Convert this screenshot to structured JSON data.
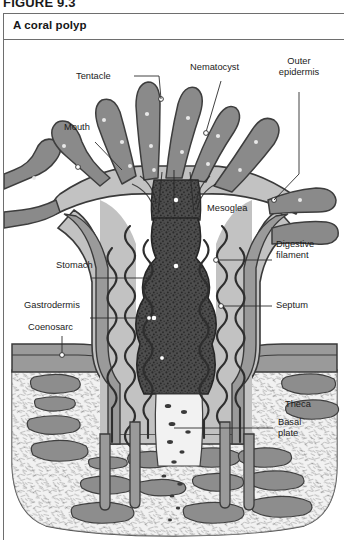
{
  "figure": {
    "number": "FIGURE 9.3",
    "title": "A coral polyp"
  },
  "labels": {
    "tentacle": "Tentacle",
    "nematocyst": "Nematocyst",
    "outer_epidermis_line1": "Outer",
    "outer_epidermis_line2": "epidermis",
    "mouth": "Mouth",
    "mesoglea": "Mesoglea",
    "digestive_filament_line1": "Digestive",
    "digestive_filament_line2": "filament",
    "stomach": "Stomach",
    "septum": "Septum",
    "gastrodermis": "Gastrodermis",
    "coenosarc": "Coenosarc",
    "theca": "Theca",
    "basal_plate_line1": "Basal",
    "basal_plate_line2": "plate"
  },
  "colors": {
    "frame_border": "#6e6e6e",
    "page_background": "#ffffff",
    "tentacle_fill": "#8a8a8a",
    "mesoglea_fill": "#c2c2c2",
    "epidermis_fill": "#9a9a9a",
    "stomach_fill": "#4a4a4a",
    "theca_fill": "#efefef",
    "skeleton_blob_fill": "#8d8d8d",
    "outline_stroke": "#3a3a3a",
    "leader_line": "#2c2c2c",
    "label_text": "#1b1b1b",
    "nematocyst_dot": "#ffffff"
  }
}
